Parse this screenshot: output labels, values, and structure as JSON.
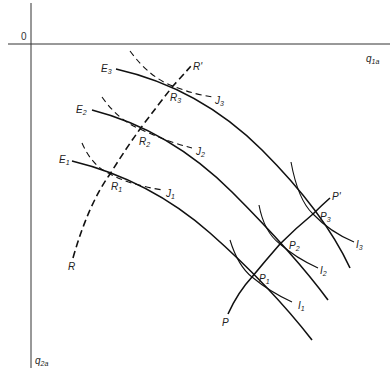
{
  "diagram": {
    "origin_label": "0",
    "x_axis": {
      "label": "q",
      "subscript": "1a"
    },
    "y_axis": {
      "label": "q",
      "subscript": "2a"
    },
    "curves": {
      "E": [
        {
          "label": "E",
          "subscript": "3"
        },
        {
          "label": "E",
          "subscript": "2"
        },
        {
          "label": "E",
          "subscript": "1"
        }
      ],
      "J": [
        {
          "label": "J",
          "subscript": "3"
        },
        {
          "label": "J",
          "subscript": "2"
        },
        {
          "label": "J",
          "subscript": "1"
        }
      ],
      "I": [
        {
          "label": "I",
          "subscript": "3"
        },
        {
          "label": "I",
          "subscript": "2"
        },
        {
          "label": "I",
          "subscript": "1"
        }
      ]
    },
    "points": {
      "R": [
        {
          "label": "R",
          "subscript": "3"
        },
        {
          "label": "R",
          "subscript": "2"
        },
        {
          "label": "R",
          "subscript": "1"
        }
      ],
      "P": [
        {
          "label": "P",
          "subscript": "3"
        },
        {
          "label": "P",
          "subscript": "2"
        },
        {
          "label": "P",
          "subscript": "1"
        }
      ]
    },
    "paths": {
      "R_start": "R",
      "R_end": "R'",
      "P_start": "P",
      "P_end": "P'"
    }
  }
}
